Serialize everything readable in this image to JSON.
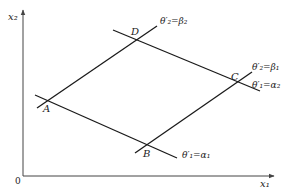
{
  "diagram": {
    "axes": {
      "y_label": "x₂",
      "x_label": "x₁",
      "origin_label": "0"
    },
    "points": {
      "A": "A",
      "B": "B",
      "C": "C",
      "D": "D"
    },
    "line_labels": {
      "AD": "θ′₂=β₂",
      "BC": "θ′₂=β₁",
      "DC": "θ′₁=α₂",
      "AB": "θ′₁=α₁"
    },
    "colors": {
      "line": "#1a1a1a",
      "axis": "#444444",
      "background": "#ffffff"
    }
  }
}
